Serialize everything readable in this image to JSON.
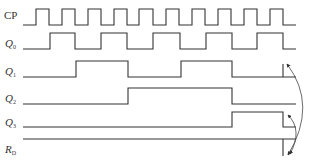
{
  "signals": [
    {
      "name": "CP",
      "main": "CP",
      "sub": "",
      "label_x": 4,
      "label_y": 10
    },
    {
      "name": "Q0",
      "main": "Q",
      "sub": "0",
      "label_x": 5,
      "label_y": 38
    },
    {
      "name": "Q1",
      "main": "Q",
      "sub": "1",
      "label_x": 5,
      "label_y": 66
    },
    {
      "name": "Q2",
      "main": "Q",
      "sub": "2",
      "label_x": 5,
      "label_y": 93
    },
    {
      "name": "Q3",
      "main": "Q",
      "sub": "3",
      "label_x": 5,
      "label_y": 117
    },
    {
      "name": "RD",
      "main": "R",
      "sub": "D",
      "label_x": 5,
      "label_y": 144
    }
  ],
  "waveforms": {
    "CP": "M23,25 L36,25 L36,9 L49,9 L49,25 L62,25 L62,9 L75,9 L75,25 L88,25 L88,9 L101,9 L101,25 L114,25 L114,9 L127,9 L127,25 L139,25 L139,9 L153,9 L153,25 L166,25 L166,9 L179,9 L179,25 L192,25 L192,9 L205,9 L205,25 L218,25 L218,9 L231,9 L231,25 L244,25 L244,9 L257,9 L257,25 L270,25 L270,9 L283,9 L283,25 L296,25",
    "Q0": "M23,49 L50,49 L50,33 L75,33 L75,49 L101,49 L101,33 L127,33 L127,49 L153,49 L153,33 L180,33 L180,49 L206,49 L206,33 L232,33 L232,49 L257,49 L257,33 L283,33 L283,49 L296,49",
    "Q1": "M23,77 L76,77 L76,61 L128,61 L128,77 L181,77 L181,61 L232,61 L232,77 L283,77 L283,64 M283,77 L296,77",
    "Q2": "M23,104 L128,104 L128,88 L232,88 L232,104 L296,104",
    "Q3": "M23,127 L232,127 L232,112 L283,112 L283,127 L296,127",
    "RD": "M23,139 L296,139 M283,139 L283,156"
  },
  "annotations": {
    "big_arc": "M287,64 Q318,105 288,155",
    "small_arc": "M288,115 Q303,130 290,154"
  },
  "colors": {
    "line": "#333333",
    "background": "#ffffff"
  }
}
